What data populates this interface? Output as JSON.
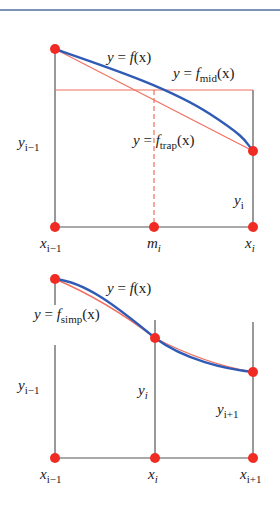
{
  "header": {
    "rule_color": "#7d94b4"
  },
  "colors": {
    "curve": "#2f5bb5",
    "approx": "#f07060",
    "point": "#f02b24",
    "axis": "#555555"
  },
  "panel1": {
    "curve_label": {
      "y": "y",
      "eq": "=",
      "f": "f",
      "arg": "(x)"
    },
    "mid_label": {
      "y": "y",
      "eq": "=",
      "f": "f",
      "sub": "mid",
      "arg": "(x)"
    },
    "trap_label": {
      "y": "y",
      "eq": "=",
      "f": "f",
      "sub": "trap",
      "arg": "(x)"
    },
    "y_left": {
      "base": "y",
      "sub": "i−1"
    },
    "y_right": {
      "base": "y",
      "sub": "i"
    },
    "x_labels": [
      {
        "base": "x",
        "sub": "i−1"
      },
      {
        "base": "m",
        "sub": "i"
      },
      {
        "base": "x",
        "sub": "i"
      }
    ]
  },
  "panel2": {
    "curve_label": {
      "y": "y",
      "eq": "=",
      "f": "f",
      "arg": "(x)"
    },
    "simp_label": {
      "y": "y",
      "eq": "=",
      "f": "f",
      "sub": "simp",
      "arg": "(x)"
    },
    "y_left": {
      "base": "y",
      "sub": "i−1"
    },
    "y_mid": {
      "base": "y",
      "sub": "i"
    },
    "y_right": {
      "base": "y",
      "sub": "i+1"
    },
    "x_labels": [
      {
        "base": "x",
        "sub": "i−1"
      },
      {
        "base": "x",
        "sub": "i"
      },
      {
        "base": "x",
        "sub": "i+1"
      }
    ]
  }
}
